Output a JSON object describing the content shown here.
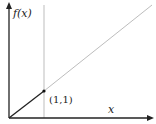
{
  "diagram": {
    "title": "",
    "y_axis_label": "f(x)",
    "x_axis_label": "x",
    "point_label": "(1,1)",
    "function": "f(x) = x",
    "colors": {
      "axes": "#222222",
      "segment_0_to_1": "#222222",
      "segment_beyond_1": "#bdbdbd",
      "vertical_line": "#bdbdbd",
      "point": "#111111"
    }
  }
}
